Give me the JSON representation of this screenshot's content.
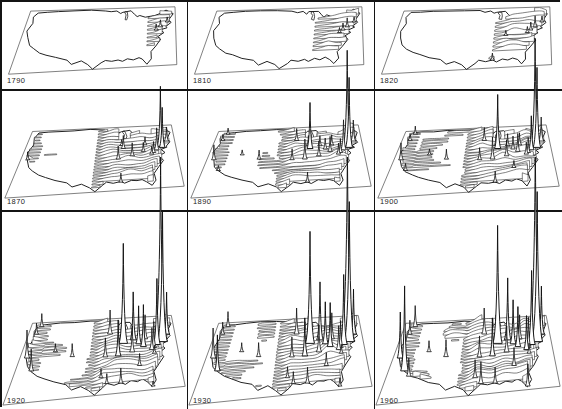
{
  "figure": {
    "grid_rows": 3,
    "grid_cols": 3,
    "ink_color": "#1a1a1a",
    "background_color": "#ffffff"
  },
  "chart_data": {
    "type": "small-multiples-3d-surface",
    "years": [
      "1790",
      "1810",
      "1820",
      "1870",
      "1890",
      "1900",
      "1920",
      "1930",
      "1960"
    ],
    "legend_position": "none",
    "grid": "off",
    "cities": {
      "boston": [
        0.945,
        0.255
      ],
      "new-york": [
        0.9,
        0.335
      ],
      "brooklyn": [
        0.911,
        0.354
      ],
      "philadelphia": [
        0.873,
        0.388
      ],
      "baltimore": [
        0.851,
        0.428
      ],
      "washington": [
        0.838,
        0.452
      ],
      "richmond": [
        0.852,
        0.505
      ],
      "pittsburgh": [
        0.786,
        0.402
      ],
      "buffalo": [
        0.8,
        0.298
      ],
      "cleveland": [
        0.756,
        0.36
      ],
      "detroit": [
        0.722,
        0.302
      ],
      "cincinnati": [
        0.714,
        0.462
      ],
      "chicago": [
        0.657,
        0.338
      ],
      "milwaukee": [
        0.646,
        0.29
      ],
      "minneapolis": [
        0.566,
        0.2
      ],
      "st-louis": [
        0.626,
        0.5
      ],
      "kansas-city": [
        0.546,
        0.5
      ],
      "new-orleans": [
        0.646,
        0.868
      ],
      "atlanta": [
        0.756,
        0.655
      ],
      "dallas": [
        0.53,
        0.77
      ],
      "houston": [
        0.566,
        0.856
      ],
      "denver": [
        0.336,
        0.46
      ],
      "salt-lake-city": [
        0.22,
        0.38
      ],
      "seattle": [
        0.076,
        0.048
      ],
      "portland": [
        0.056,
        0.14
      ],
      "san-francisco": [
        0.046,
        0.432
      ],
      "los-angeles": [
        0.1,
        0.6
      ],
      "san-diego": [
        0.136,
        0.672
      ],
      "miami": [
        0.826,
        0.95
      ]
    },
    "panels": [
      {
        "year": "1790",
        "frontier": 0.8,
        "ramp": 0.1,
        "amp": 5,
        "west": 0,
        "scatter": 0,
        "ycut": 0.7,
        "patches": [
          [
            0.665,
            0.47,
            0.035,
            0.8
          ]
        ],
        "spikes": {
          "new-york": 7,
          "philadelphia": 6,
          "boston": 5
        }
      },
      {
        "year": "1810",
        "frontier": 0.665,
        "ramp": 0.12,
        "amp": 5.5,
        "west": 0,
        "scatter": 0,
        "ycut": 0.72,
        "patches": [
          [
            0.645,
            0.86,
            0.03,
            0.7
          ]
        ],
        "spikes": {
          "new-york": 9,
          "philadelphia": 7,
          "boston": 5,
          "baltimore": 5
        }
      },
      {
        "year": "1820",
        "frontier": 0.615,
        "ramp": 0.13,
        "amp": 6,
        "west": 0,
        "scatter": 0,
        "ycut": 0.75,
        "patches": [
          [
            0.645,
            0.862,
            0.035,
            0.9
          ],
          [
            0.6,
            0.62,
            0.03,
            0.5
          ]
        ],
        "spikes": {
          "new-york": 11,
          "philadelphia": 8,
          "boston": 6,
          "baltimore": 6,
          "cincinnati": 5,
          "new-orleans": 7
        }
      },
      {
        "year": "1870",
        "frontier": 0.455,
        "ramp": 0.14,
        "amp": 7.5,
        "west": 0.25,
        "scatter": 0.15,
        "ycut": 0,
        "patches": [
          [
            0.046,
            0.43,
            0.03,
            0.8
          ]
        ],
        "spikes": {
          "new-york": 60,
          "brooklyn": 40,
          "philadelphia": 22,
          "boston": 14,
          "baltimore": 11,
          "washington": 8,
          "pittsburgh": 9,
          "buffalo": 8,
          "cincinnati": 13,
          "chicago": 13,
          "st-louis": 13,
          "milwaukee": 6,
          "new-orleans": 9,
          "san-francisco": 8
        }
      },
      {
        "year": "1890",
        "frontier": 0.435,
        "ramp": 0.13,
        "amp": 8,
        "west": 0.45,
        "scatter": 0.35,
        "ycut": 0,
        "patches": [],
        "spikes": {
          "new-york": 96,
          "brooklyn": 70,
          "philadelphia": 30,
          "boston": 21,
          "baltimore": 14,
          "washington": 11,
          "pittsburgh": 15,
          "buffalo": 10,
          "cleveland": 11,
          "detroit": 10,
          "cincinnati": 15,
          "chicago": 46,
          "milwaukee": 10,
          "minneapolis": 12,
          "st-louis": 20,
          "kansas-city": 11,
          "new-orleans": 10,
          "denver": 9,
          "san-francisco": 15,
          "los-angeles": 5,
          "portland": 6,
          "seattle": 6,
          "salt-lake-city": 5
        }
      },
      {
        "year": "1900",
        "frontier": 0.43,
        "ramp": 0.13,
        "amp": 8.5,
        "west": 0.5,
        "scatter": 0.4,
        "ycut": 0,
        "patches": [],
        "spikes": {
          "new-york": 108,
          "brooklyn": 80,
          "philadelphia": 34,
          "boston": 24,
          "baltimore": 15,
          "washington": 12,
          "pittsburgh": 18,
          "buffalo": 12,
          "cleveland": 13,
          "detroit": 12,
          "cincinnati": 16,
          "chicago": 54,
          "milwaukee": 11,
          "minneapolis": 13,
          "st-louis": 22,
          "kansas-city": 12,
          "new-orleans": 11,
          "denver": 10,
          "san-francisco": 17,
          "los-angeles": 7,
          "portland": 7,
          "seattle": 8,
          "salt-lake-city": 6,
          "atlanta": 7
        }
      },
      {
        "year": "1920",
        "frontier": 0.42,
        "ramp": 0.12,
        "amp": 10,
        "west": 0.55,
        "scatter": 0.45,
        "ycut": 0,
        "patches": [],
        "spikes": {
          "new-york": 185,
          "brooklyn": 130,
          "philadelphia": 66,
          "boston": 42,
          "baltimore": 26,
          "washington": 22,
          "pittsburgh": 42,
          "buffalo": 24,
          "cleveland": 38,
          "detroit": 48,
          "cincinnati": 26,
          "chicago": 100,
          "milwaukee": 22,
          "minneapolis": 24,
          "st-louis": 36,
          "kansas-city": 19,
          "new-orleans": 15,
          "denver": 13,
          "san-francisco": 28,
          "los-angeles": 22,
          "portland": 11,
          "seattle": 13,
          "salt-lake-city": 8,
          "atlanta": 12,
          "dallas": 9,
          "houston": 10,
          "richmond": 8,
          "miami": 5
        }
      },
      {
        "year": "1930",
        "frontier": 0.42,
        "ramp": 0.12,
        "amp": 10,
        "west": 0.6,
        "scatter": 0.45,
        "ycut": 0,
        "patches": [],
        "spikes": {
          "new-york": 196,
          "brooklyn": 140,
          "philadelphia": 70,
          "boston": 45,
          "baltimore": 27,
          "washington": 24,
          "pittsburgh": 44,
          "buffalo": 26,
          "cleveland": 42,
          "detroit": 58,
          "cincinnati": 27,
          "chicago": 112,
          "milwaukee": 24,
          "minneapolis": 26,
          "st-louis": 38,
          "kansas-city": 20,
          "new-orleans": 16,
          "denver": 14,
          "san-francisco": 30,
          "los-angeles": 36,
          "portland": 12,
          "seattle": 15,
          "salt-lake-city": 9,
          "atlanta": 13,
          "dallas": 11,
          "houston": 12,
          "richmond": 9,
          "miami": 8
        }
      },
      {
        "year": "1960",
        "frontier": 0.415,
        "ramp": 0.12,
        "amp": 11,
        "west": 0.65,
        "scatter": 0.5,
        "ycut": 0,
        "patches": [],
        "spikes": {
          "new-york": 200,
          "brooklyn": 150,
          "philadelphia": 74,
          "boston": 48,
          "baltimore": 30,
          "washington": 34,
          "pittsburgh": 40,
          "buffalo": 24,
          "cleveland": 44,
          "detroit": 62,
          "cincinnati": 26,
          "chicago": 118,
          "milwaukee": 25,
          "minneapolis": 26,
          "st-louis": 38,
          "kansas-city": 21,
          "new-orleans": 16,
          "denver": 17,
          "san-francisco": 46,
          "los-angeles": 85,
          "san-diego": 18,
          "portland": 14,
          "seattle": 21,
          "salt-lake-city": 11,
          "atlanta": 18,
          "dallas": 18,
          "houston": 22,
          "richmond": 10,
          "miami": 22
        }
      }
    ]
  }
}
